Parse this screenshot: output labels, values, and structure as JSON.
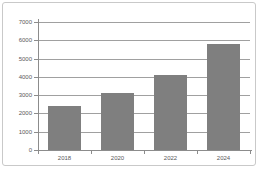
{
  "chart_data": {
    "type": "bar",
    "categories": [
      "2018",
      "2020",
      "2022",
      "2024"
    ],
    "values": [
      2400,
      3100,
      4100,
      5800
    ],
    "yticks": [
      0,
      1000,
      2000,
      3000,
      4000,
      5000,
      6000,
      7000
    ],
    "ytick_labels": [
      "0",
      "1000",
      "2000",
      "3000",
      "4000",
      "5000",
      "6000",
      "7000"
    ],
    "ylim": [
      0,
      7000
    ],
    "grid": true,
    "legend": false,
    "colors": {
      "bar": "#7f7f7f",
      "gridline": "#a0a0a0",
      "axis": "#8c8c8c",
      "tick_label": "#595959",
      "frame_border": "#c9c9c9",
      "background": "#ffffff"
    }
  }
}
